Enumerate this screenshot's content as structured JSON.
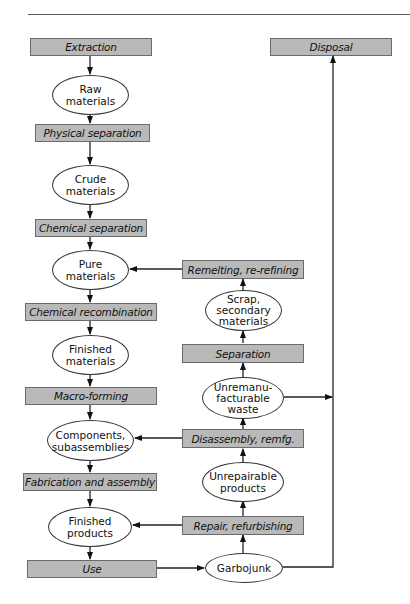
{
  "diagram": {
    "processes": {
      "extraction": "Extraction",
      "physical_separation": "Physical separation",
      "chemical_separation": "Chemical separation",
      "chemical_recombination": "Chemical recombination",
      "macro_forming": "Macro-forming",
      "fabrication_assembly": "Fabrication and assembly",
      "use": "Use",
      "disposal": "Disposal",
      "remelting": "Remelting, re-refining",
      "separation": "Separation",
      "disassembly": "Disassembly, remfg.",
      "repair": "Repair, refurbishing"
    },
    "states": {
      "raw_materials": "Raw materials",
      "crude_materials": "Crude materials",
      "pure_materials": "Pure materials",
      "finished_materials": "Finished materials",
      "components": "Components, subassemblies",
      "finished_products": "Finished products",
      "scrap": "Scrap, secondary materials",
      "unremanufacturable": "Unremanu- facturable waste",
      "unrepairable": "Unrepairable products",
      "garbojunk": "Garbojunk"
    },
    "state_lines": {
      "raw_materials": [
        "Raw",
        "materials"
      ],
      "crude_materials": [
        "Crude",
        "materials"
      ],
      "pure_materials": [
        "Pure",
        "materials"
      ],
      "finished_materials": [
        "Finished",
        "materials"
      ],
      "components": [
        "Components,",
        "subassemblies"
      ],
      "finished_products": [
        "Finished",
        "products"
      ],
      "scrap": [
        "Scrap,",
        "secondary",
        "materials"
      ],
      "unremanufacturable": [
        "Unremanu-",
        "facturable",
        "waste"
      ],
      "unrepairable": [
        "Unrepairable",
        "products"
      ],
      "garbojunk": [
        "Garbojunk"
      ]
    },
    "edges": [
      [
        "Extraction",
        "Raw materials"
      ],
      [
        "Raw materials",
        "Physical separation"
      ],
      [
        "Physical separation",
        "Crude materials"
      ],
      [
        "Crude materials",
        "Chemical separation"
      ],
      [
        "Chemical separation",
        "Pure materials"
      ],
      [
        "Pure materials",
        "Chemical recombination"
      ],
      [
        "Chemical recombination",
        "Finished materials"
      ],
      [
        "Finished materials",
        "Macro-forming"
      ],
      [
        "Macro-forming",
        "Components, subassemblies"
      ],
      [
        "Components, subassemblies",
        "Fabrication and assembly"
      ],
      [
        "Fabrication and assembly",
        "Finished products"
      ],
      [
        "Finished products",
        "Use"
      ],
      [
        "Use",
        "Garbojunk"
      ],
      [
        "Garbojunk",
        "Repair, refurbishing"
      ],
      [
        "Repair, refurbishing",
        "Finished products"
      ],
      [
        "Repair, refurbishing",
        "Unrepairable products"
      ],
      [
        "Unrepairable products",
        "Disassembly, remfg."
      ],
      [
        "Disassembly, remfg.",
        "Components, subassemblies"
      ],
      [
        "Disassembly, remfg.",
        "Unremanufacturable waste"
      ],
      [
        "Unremanufacturable waste",
        "Separation"
      ],
      [
        "Unremanufacturable waste",
        "Disposal"
      ],
      [
        "Separation",
        "Scrap, secondary materials"
      ],
      [
        "Scrap, secondary materials",
        "Remelting, re-refining"
      ],
      [
        "Remelting, re-refining",
        "Pure materials"
      ],
      [
        "Garbojunk",
        "Disposal"
      ]
    ]
  }
}
